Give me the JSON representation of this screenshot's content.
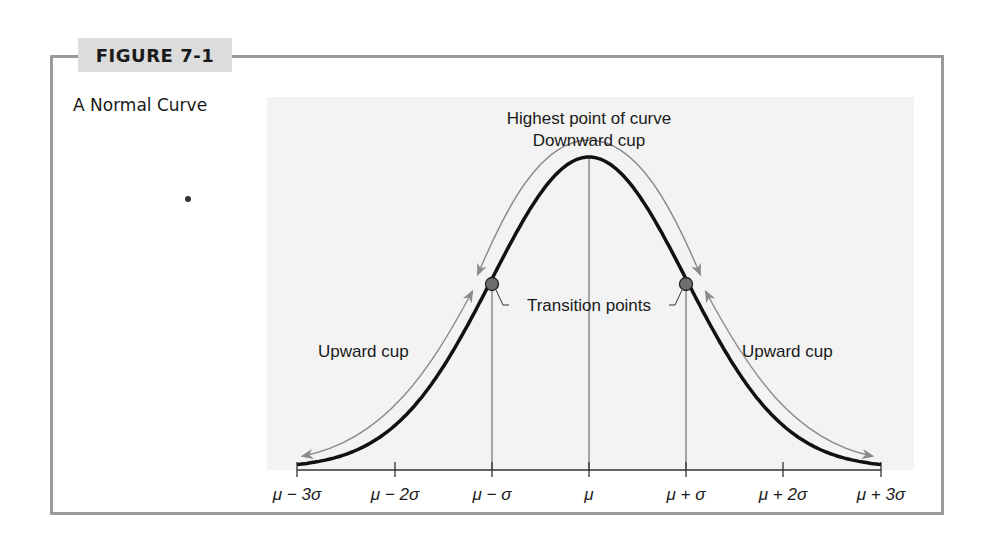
{
  "figure": {
    "label": "FIGURE 7-1",
    "title": "A Normal Curve"
  },
  "annotations": {
    "peak_line1": "Highest point of curve",
    "peak_line2": "Downward cup",
    "transition": "Transition points",
    "upward_left": "Upward cup",
    "upward_right": "Upward cup"
  },
  "colors": {
    "frame": "#9a9a9a",
    "label_bg": "#dcdcdc",
    "plot_bg": "#f3f3f3",
    "curve": "#111111",
    "arrows": "#8a8a8a",
    "points": "#6e6e6e"
  },
  "chart_data": {
    "type": "line",
    "title": "A Normal Curve",
    "xlabel": "",
    "ylabel": "",
    "categories": [
      "μ − 3σ",
      "μ − 2σ",
      "μ − σ",
      "μ",
      "μ + σ",
      "μ + 2σ",
      "μ + 3σ"
    ],
    "x": [
      -3,
      -2,
      -1,
      0,
      1,
      2,
      3
    ],
    "values": [
      0.011,
      0.135,
      0.607,
      1.0,
      0.607,
      0.135,
      0.011
    ],
    "series": [
      {
        "name": "Normal density (relative height)",
        "x": [
          -3,
          -2,
          -1,
          0,
          1,
          2,
          3
        ],
        "values": [
          0.011,
          0.135,
          0.607,
          1.0,
          0.607,
          0.135,
          0.011
        ]
      }
    ],
    "xlim": [
      -3,
      3
    ],
    "ylim": [
      0,
      1
    ],
    "grid": false,
    "legend": "none",
    "vertical_lines_at": [
      -1,
      0,
      1
    ],
    "marked_points": [
      {
        "x": -1,
        "label": "Transition points"
      },
      {
        "x": 1,
        "label": "Transition points"
      }
    ],
    "annotations": [
      {
        "text": "Highest point of curve",
        "x": 0
      },
      {
        "text": "Downward cup",
        "x": 0
      },
      {
        "text": "Transition points",
        "x": 0
      },
      {
        "text": "Upward cup",
        "x": -2.3
      },
      {
        "text": "Upward cup",
        "x": 2.3
      }
    ]
  },
  "axis": {
    "ticks": [
      "μ − 3σ",
      "μ − 2σ",
      "μ − σ",
      "μ",
      "μ + σ",
      "μ + 2σ",
      "μ + 3σ"
    ]
  }
}
